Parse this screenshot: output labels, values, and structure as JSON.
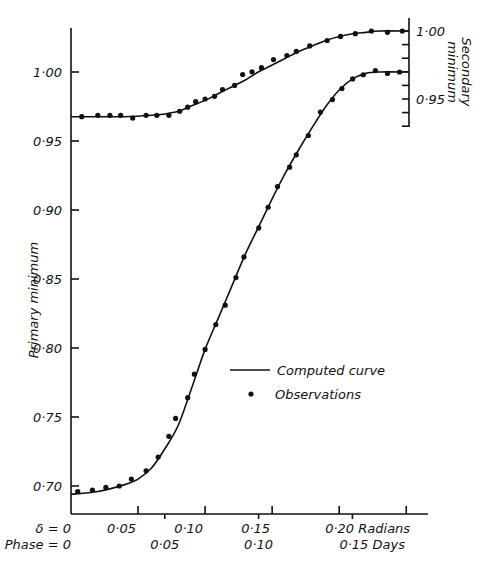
{
  "chart_data": {
    "type": "line",
    "title": "",
    "xlabel": "Radians / Days",
    "ylabel": "Primary minimum",
    "y2label": "Secondary minimum",
    "xlim": [
      0,
      0.27
    ],
    "ylim": [
      0.675,
      1.04
    ],
    "y2lim": [
      0.925,
      1.01
    ],
    "grid": false,
    "legend_position": "center-right (inside plot)",
    "x_axis": {
      "radians_ticks": [
        {
          "value": 0,
          "label": "δ = 0"
        },
        {
          "value": 0.05,
          "label": "0·05"
        },
        {
          "value": 0.1,
          "label": "0·10"
        },
        {
          "value": 0.15,
          "label": "0·15"
        },
        {
          "value": 0.2,
          "label": "0·20 Radians"
        },
        {
          "value": 0.25,
          "label": ""
        }
      ],
      "days_ticks": [
        {
          "value": 0,
          "label": "Phase = 0"
        },
        {
          "value": 0.05,
          "label": "0·05"
        },
        {
          "value": 0.1,
          "label": "0·10"
        },
        {
          "value": 0.15,
          "label": "0·15 Days"
        }
      ]
    },
    "y_axis_left": {
      "label": "Primary minimum",
      "ticks": [
        {
          "value": 1.0,
          "label": "1·00"
        },
        {
          "value": 0.95,
          "label": "0·95"
        },
        {
          "value": 0.9,
          "label": "0·90"
        },
        {
          "value": 0.85,
          "label": "0·85"
        },
        {
          "value": 0.8,
          "label": "0·80"
        },
        {
          "value": 0.75,
          "label": "0·75"
        },
        {
          "value": 0.7,
          "label": "0·70"
        }
      ]
    },
    "y_axis_right": {
      "label": "Secondary minimum",
      "ticks": [
        {
          "value": 1.0,
          "label": "1·00"
        },
        {
          "value": 0.99,
          "label": ""
        },
        {
          "value": 0.98,
          "label": ""
        },
        {
          "value": 0.97,
          "label": ""
        },
        {
          "value": 0.96,
          "label": ""
        },
        {
          "value": 0.95,
          "label": "0·95"
        },
        {
          "value": 0.94,
          "label": ""
        },
        {
          "value": 0.93,
          "label": ""
        }
      ]
    },
    "legend": [
      {
        "symbol": "line",
        "label": "Computed curve"
      },
      {
        "symbol": "dot",
        "label": "Observations"
      }
    ],
    "series": [
      {
        "name": "Primary minimum",
        "axis": "left",
        "observations": {
          "x": [
            0.005,
            0.016,
            0.026,
            0.036,
            0.045,
            0.056,
            0.065,
            0.073,
            0.078,
            0.087,
            0.092,
            0.1,
            0.108,
            0.115,
            0.123,
            0.129,
            0.14,
            0.147,
            0.154,
            0.163,
            0.168,
            0.177,
            0.186,
            0.195,
            0.202,
            0.21,
            0.218,
            0.227,
            0.236,
            0.245
          ],
          "y": [
            0.696,
            0.697,
            0.699,
            0.7,
            0.705,
            0.711,
            0.721,
            0.736,
            0.749,
            0.764,
            0.781,
            0.799,
            0.817,
            0.831,
            0.851,
            0.866,
            0.887,
            0.902,
            0.917,
            0.931,
            0.94,
            0.954,
            0.971,
            0.98,
            0.988,
            0.995,
            0.998,
            1.001,
            0.999,
            1.0
          ]
        },
        "computed_curve": {
          "x": [
            0.0,
            0.02,
            0.04,
            0.05,
            0.06,
            0.07,
            0.08,
            0.09,
            0.1,
            0.11,
            0.12,
            0.13,
            0.14,
            0.15,
            0.16,
            0.17,
            0.18,
            0.19,
            0.2,
            0.21,
            0.22,
            0.23,
            0.25
          ],
          "y": [
            0.694,
            0.696,
            0.701,
            0.705,
            0.713,
            0.727,
            0.744,
            0.771,
            0.799,
            0.822,
            0.845,
            0.868,
            0.888,
            0.908,
            0.927,
            0.944,
            0.96,
            0.975,
            0.987,
            0.995,
            0.999,
            1.0,
            1.0
          ]
        }
      },
      {
        "name": "Secondary minimum",
        "axis": "right",
        "observations": {
          "x": [
            0.008,
            0.02,
            0.029,
            0.037,
            0.046,
            0.056,
            0.064,
            0.073,
            0.081,
            0.087,
            0.093,
            0.1,
            0.107,
            0.113,
            0.122,
            0.128,
            0.135,
            0.142,
            0.151,
            0.161,
            0.168,
            0.178,
            0.191,
            0.201,
            0.212,
            0.224,
            0.236,
            0.247
          ],
          "y": [
            0.937,
            0.938,
            0.938,
            0.938,
            0.936,
            0.938,
            0.938,
            0.938,
            0.941,
            0.944,
            0.948,
            0.95,
            0.952,
            0.957,
            0.96,
            0.968,
            0.97,
            0.973,
            0.979,
            0.982,
            0.985,
            0.989,
            0.993,
            0.996,
            0.998,
            1.0,
            0.999,
            1.0
          ]
        },
        "computed_curve": {
          "x": [
            0.0,
            0.02,
            0.04,
            0.06,
            0.07,
            0.08,
            0.09,
            0.1,
            0.11,
            0.12,
            0.13,
            0.14,
            0.15,
            0.16,
            0.17,
            0.18,
            0.19,
            0.2,
            0.21,
            0.22,
            0.23,
            0.25
          ],
          "y": [
            0.937,
            0.937,
            0.937,
            0.938,
            0.939,
            0.941,
            0.945,
            0.949,
            0.954,
            0.959,
            0.964,
            0.97,
            0.975,
            0.98,
            0.985,
            0.989,
            0.993,
            0.996,
            0.998,
            0.999,
            1.0,
            1.0
          ]
        }
      }
    ]
  }
}
